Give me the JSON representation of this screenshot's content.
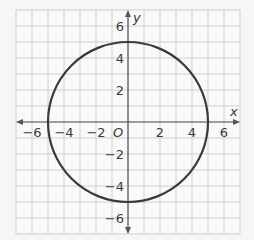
{
  "chart_data": {
    "type": "scatter",
    "title": "",
    "shape": {
      "kind": "circle",
      "center": [
        0,
        0
      ],
      "radius": 5,
      "equation": "x^2 + y^2 = 25"
    },
    "xlabel": "x",
    "ylabel": "y",
    "origin_label": "O",
    "xlim": [
      -7,
      7
    ],
    "ylim": [
      -7,
      7
    ],
    "grid": true,
    "grid_step": 1,
    "x_ticks": [
      -6,
      -4,
      -2,
      2,
      4,
      6
    ],
    "y_ticks": [
      6,
      4,
      2,
      -2,
      -4,
      -6
    ],
    "x_tick_labels": [
      "−6",
      "−4",
      "−2",
      "2",
      "4",
      "6"
    ],
    "y_tick_labels": [
      "6",
      "4",
      "2",
      "−2",
      "−4",
      "−6"
    ],
    "key_points": [
      [
        5,
        0
      ],
      [
        -5,
        0
      ],
      [
        0,
        5
      ],
      [
        0,
        -5
      ]
    ],
    "colors": {
      "grid": "#cfcfcf",
      "axis": "#555555",
      "curve": "#3a3a3a",
      "background": "#f6f6f6"
    }
  }
}
